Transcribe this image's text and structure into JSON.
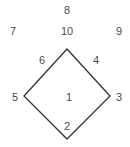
{
  "diagram": {
    "type": "baseball-position-numbers",
    "line_color": "#333333",
    "text_color": "#4a4a4a",
    "diamond": {
      "top": [
        67,
        49
      ],
      "right": [
        110,
        96
      ],
      "bottom": [
        67,
        139
      ],
      "left": [
        24,
        96
      ]
    },
    "positions": [
      {
        "number": "8",
        "x": 67,
        "y": 10
      },
      {
        "number": "7",
        "x": 13,
        "y": 31
      },
      {
        "number": "10",
        "x": 67,
        "y": 31
      },
      {
        "number": "9",
        "x": 119,
        "y": 31
      },
      {
        "number": "6",
        "x": 42,
        "y": 60
      },
      {
        "number": "4",
        "x": 96,
        "y": 60
      },
      {
        "number": "5",
        "x": 15,
        "y": 97
      },
      {
        "number": "1",
        "x": 69,
        "y": 97
      },
      {
        "number": "3",
        "x": 119,
        "y": 97
      },
      {
        "number": "2",
        "x": 67,
        "y": 126
      }
    ]
  }
}
